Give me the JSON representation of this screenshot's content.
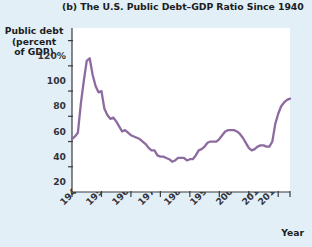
{
  "figure": {
    "panel_label": "(b)",
    "title": "(b) The U.S. Public Debt–GDP Ratio Since 1940",
    "background_color": "#e2eff6",
    "plot_background_color": "#ffffff",
    "line_color": "#8d6ba0",
    "axis_color": "#3a3a42"
  },
  "chart_data": {
    "type": "line",
    "title": "(b) The U.S. Public Debt–GDP Ratio Since 1940",
    "xlabel": "Year",
    "ylabel": "Public debt (percent of GDP)",
    "ylabel_lines": [
      "Public debt",
      "(percent",
      "of GDP)"
    ],
    "xlim": [
      1940,
      2014
    ],
    "ylim": [
      0,
      130
    ],
    "grid": false,
    "legend": "none",
    "ytick_labels": [
      "120%",
      "100",
      "80",
      "60",
      "40",
      "20"
    ],
    "ytick_values": [
      120,
      100,
      80,
      60,
      40,
      20
    ],
    "xtick_labels": [
      "1940",
      "1950",
      "1960",
      "1970",
      "1980",
      "1990",
      "2000",
      "2010",
      "2014"
    ],
    "xtick_values": [
      1940,
      1950,
      1960,
      1970,
      1980,
      1990,
      2000,
      2010,
      2014
    ],
    "series": [
      {
        "name": "U.S. public debt as percent of GDP",
        "color": "#8d6ba0",
        "x": [
          1940,
          1941,
          1942,
          1943,
          1944,
          1945,
          1946,
          1947,
          1948,
          1949,
          1950,
          1951,
          1952,
          1953,
          1954,
          1955,
          1956,
          1957,
          1958,
          1959,
          1960,
          1961,
          1962,
          1963,
          1964,
          1965,
          1966,
          1967,
          1968,
          1969,
          1970,
          1971,
          1972,
          1973,
          1974,
          1975,
          1976,
          1977,
          1978,
          1979,
          1980,
          1981,
          1982,
          1983,
          1984,
          1985,
          1986,
          1987,
          1988,
          1989,
          1990,
          1991,
          1992,
          1993,
          1994,
          1995,
          1996,
          1997,
          1998,
          1999,
          2000,
          2001,
          2002,
          2003,
          2004,
          2005,
          2006,
          2007,
          2008,
          2009,
          2010,
          2011,
          2012,
          2013,
          2014
        ],
        "y": [
          42,
          44,
          47,
          70,
          88,
          104,
          106,
          93,
          84,
          79,
          80,
          66,
          61,
          58,
          59,
          56,
          52,
          48,
          49,
          47,
          45,
          44,
          43,
          42,
          40,
          38,
          35,
          33,
          33,
          29,
          28,
          28,
          27,
          26,
          24,
          25,
          27,
          27,
          27,
          25,
          26,
          26,
          29,
          33,
          34,
          36,
          39,
          40,
          40,
          40,
          42,
          45,
          48,
          49,
          49,
          49,
          48,
          46,
          43,
          39,
          35,
          33,
          34,
          36,
          37,
          37,
          36,
          36,
          40,
          54,
          62,
          68,
          71,
          73,
          74
        ]
      }
    ]
  }
}
